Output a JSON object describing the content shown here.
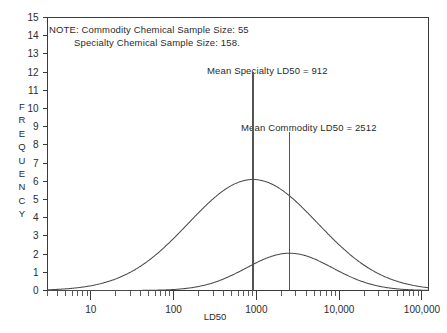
{
  "figure": {
    "background": "#ffffff",
    "line_color": "#4a4a4a",
    "text_color": "#2b2b2b"
  },
  "notes": {
    "line1": "NOTE: Commodity Chemical Sample Size: 55",
    "line2": "Specialty Chemical Sample Size: 158."
  },
  "annotations": {
    "specialty": "Mean Specialty LD50 = 912",
    "commodity": "Mean Commodity LD50 = 2512"
  },
  "axes": {
    "xlabel": "LD50",
    "ylabel_letters": [
      "F",
      "R",
      "E",
      "Q",
      "U",
      "E",
      "N",
      "C",
      "Y"
    ],
    "ylabel": "FREQUENCY",
    "ytick_labels": [
      "15",
      "14",
      "13",
      "12",
      "11",
      "10",
      "9",
      "8",
      "7",
      "6",
      "5",
      "4",
      "3",
      "2",
      "1",
      "0"
    ],
    "xtick_labels": [
      "10",
      "100",
      "1000",
      "10,000",
      "100,000"
    ]
  },
  "chart_data": {
    "type": "line",
    "title": "",
    "xlabel": "LD50",
    "ylabel": "FREQUENCY",
    "xscale": "log",
    "xlim": [
      3,
      120000
    ],
    "ylim": [
      0,
      15
    ],
    "ytick_values": [
      0,
      1,
      2,
      3,
      4,
      5,
      6,
      7,
      8,
      9,
      10,
      11,
      12,
      13,
      14,
      15
    ],
    "xtick_values": [
      10,
      100,
      1000,
      10000,
      100000
    ],
    "grid": false,
    "legend": "none",
    "series": [
      {
        "name": "Specialty Chemical",
        "sample_size": 158,
        "mean_ld50": 912,
        "peak_frequency": 6.1,
        "peak_x": 912,
        "log_sigma_decades": 0.78,
        "x": [
          3,
          5,
          8,
          12,
          20,
          32,
          50,
          80,
          125,
          200,
          320,
          500,
          800,
          912,
          1250,
          2000,
          3200,
          5000,
          8000,
          12500,
          20000,
          32000,
          50000,
          80000,
          120000
        ],
        "y": [
          0.05,
          0.1,
          0.2,
          0.35,
          0.65,
          1.1,
          1.8,
          2.7,
          3.7,
          4.7,
          5.5,
          5.95,
          6.1,
          6.1,
          5.85,
          5.1,
          4.0,
          2.9,
          1.95,
          1.25,
          0.75,
          0.4,
          0.2,
          0.1,
          0.03
        ]
      },
      {
        "name": "Commodity Chemical",
        "sample_size": 55,
        "mean_ld50": 2512,
        "peak_frequency": 2.05,
        "peak_x": 2512,
        "log_sigma_decades": 0.52,
        "x": [
          3,
          10,
          32,
          100,
          200,
          320,
          500,
          800,
          1250,
          2000,
          2512,
          3200,
          5000,
          8000,
          12500,
          20000,
          32000,
          50000,
          80000,
          120000
        ],
        "y": [
          0.0,
          0.0,
          0.02,
          0.08,
          0.2,
          0.38,
          0.72,
          1.15,
          1.6,
          1.97,
          2.05,
          2.0,
          1.7,
          1.25,
          0.82,
          0.48,
          0.25,
          0.11,
          0.04,
          0.01
        ]
      }
    ],
    "vertical_lines": [
      {
        "name": "mean-specialty",
        "x": 912,
        "label": "Mean Specialty LD50 = 912",
        "y_top": 12.0
      },
      {
        "name": "mean-commodity",
        "x": 2512,
        "label": "Mean Commodity LD50 = 2512",
        "y_top": 8.7
      }
    ]
  }
}
